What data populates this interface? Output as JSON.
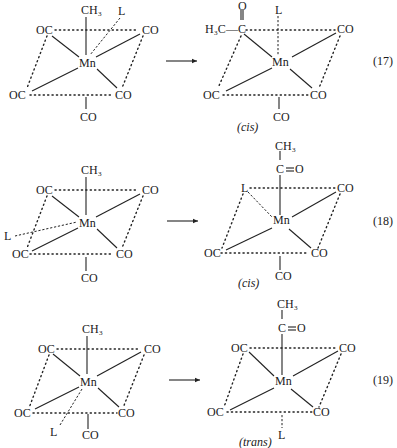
{
  "diagram": {
    "reactions": [
      {
        "number": "(17)",
        "reactant": {
          "center": "Mn",
          "axial_top": "CH3",
          "extra_ligand": "L",
          "equatorial": [
            "OC",
            "CO",
            "OC",
            "CO"
          ],
          "axial_bottom": "CO"
        },
        "product": {
          "center": "Mn",
          "acyl": {
            "carbon": "C",
            "oxygen": "O",
            "methyl": "H3C",
            "dash": "—"
          },
          "axial_top": "L",
          "equatorial": [
            "CO",
            "OC",
            "CO"
          ],
          "axial_bottom": "CO",
          "label": "cis"
        }
      },
      {
        "number": "(18)",
        "reactant": {
          "center": "Mn",
          "axial_top": "CH3",
          "extra_ligand": "L",
          "equatorial": [
            "OC",
            "CO",
            "OC",
            "CO"
          ],
          "axial_bottom": "CO"
        },
        "product": {
          "center": "Mn",
          "acyl": {
            "methyl": "CH3",
            "carbon": "C",
            "oxygen": "O"
          },
          "equatorial": [
            "L",
            "CO",
            "OC",
            "CO"
          ],
          "axial_bottom": "CO",
          "label": "cis"
        }
      },
      {
        "number": "(19)",
        "reactant": {
          "center": "Mn",
          "axial_top": "CH3",
          "extra_ligand": "L",
          "equatorial": [
            "OC",
            "CO",
            "OC",
            "CO"
          ],
          "axial_bottom": "CO"
        },
        "product": {
          "center": "Mn",
          "acyl": {
            "methyl": "CH3",
            "carbon": "C",
            "oxygen": "O"
          },
          "equatorial": [
            "OC",
            "CO",
            "OC",
            "CO"
          ],
          "axial_bottom": "L",
          "label": "trans"
        }
      }
    ],
    "arrow": "reaction-arrow"
  }
}
